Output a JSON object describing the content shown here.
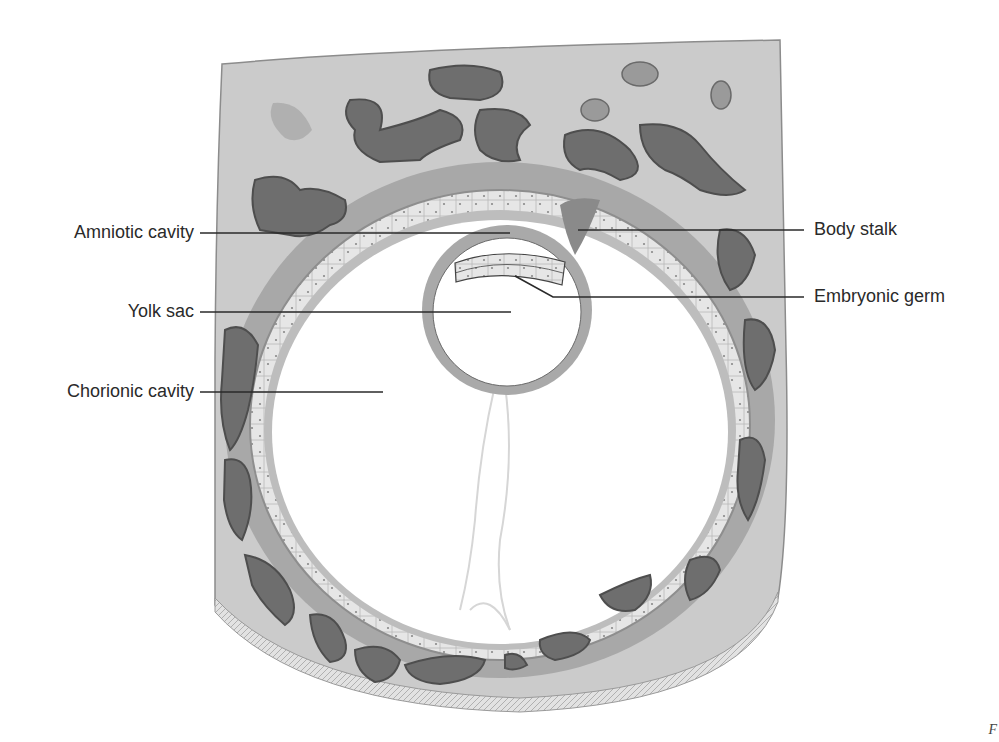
{
  "figure": {
    "labels": {
      "amniotic_cavity": "Amniotic cavity",
      "yolk_sac": "Yolk sac",
      "chorionic_cavity": "Chorionic cavity",
      "body_stalk": "Body stalk",
      "embryonic_germ": "Embryonic germ"
    },
    "corner_mark": "F"
  },
  "colors": {
    "decidua": "#c9c9c9",
    "villi_dark": "#6e6e6e",
    "trophoblast_mid": "#a9a9a9",
    "cell_layer": "#e4e4e4",
    "membrane": "#9a9a9a",
    "leader_line": "#2a2a2a",
    "label_text": "#2a2a2a"
  }
}
